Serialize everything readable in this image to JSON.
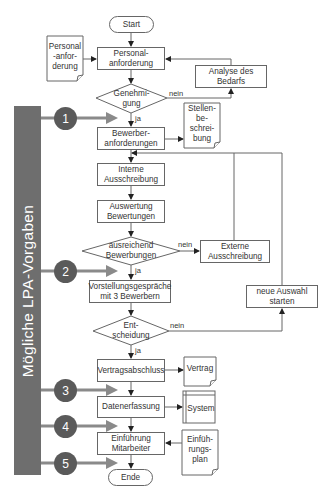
{
  "sidebar": {
    "label": "Mögliche LPA-Vorgaben",
    "color": "#6e6e6e"
  },
  "markers": [
    {
      "number": "1"
    },
    {
      "number": "2"
    },
    {
      "number": "3"
    },
    {
      "number": "4"
    },
    {
      "number": "5"
    }
  ],
  "flow": {
    "start": "Start",
    "personalanforderung": "Personal-\nanforderung",
    "genehmigung": "Genehmi-\ngung",
    "bewerberanforderungen": "Bewerber-\nanforderungen",
    "interne_ausschreibung": "Interne\nAusschreibung",
    "auswertung": "Auswertung\nBewertungen",
    "ausreichend": "ausreichend\nBewerbungen",
    "vorstellung": "Vorstellungsgespräche\nmit 3 Bewerbern",
    "entscheidung": "Ent-\nscheidung",
    "vertragsabschluss": "Vertragsabschluss",
    "datenerfassung": "Datenerfassung",
    "einfuehrung": "Einführung\nMitarbeiter",
    "ende": "Ende",
    "analyse": "Analyse des\nBedarfs",
    "externe": "Externe\nAusschreibung",
    "neue_auswahl": "neue Auswahl\nstarten"
  },
  "documents": {
    "personal_doc": "Personal\n-anfor-\nderung",
    "stellen_doc": "Stellen-\nbe-\nschrei-\nbung",
    "vertrag_doc": "Vertrag",
    "system": "System",
    "einfuehrungsplan_doc": "Einfüh-\nrungs-\nplan"
  },
  "labels": {
    "yes": "ja",
    "no": "nein"
  }
}
